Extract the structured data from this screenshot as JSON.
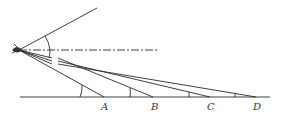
{
  "diagram": {
    "points": [
      {
        "id": "A",
        "label": "A"
      },
      {
        "id": "B",
        "label": "B"
      },
      {
        "id": "C",
        "label": "C"
      },
      {
        "id": "D",
        "label": "D"
      }
    ],
    "observer": {
      "icon": "eye-icon"
    },
    "reference_line_style": "dash-dot",
    "colors": {
      "ink": "#2a2a2a",
      "background": "#ffffff"
    }
  }
}
